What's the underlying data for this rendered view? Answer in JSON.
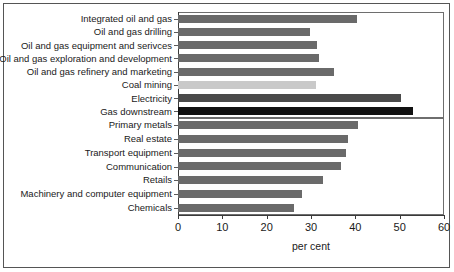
{
  "chart_data": {
    "type": "bar",
    "orientation": "horizontal",
    "title": "",
    "xlabel": "per cent",
    "ylabel": "",
    "xlim": [
      0,
      60
    ],
    "xticks": [
      0,
      10,
      20,
      30,
      40,
      50,
      60
    ],
    "xtick_labels": [
      "0",
      "10",
      "20",
      "30",
      "40",
      "50",
      "60"
    ],
    "grid": false,
    "legend": false,
    "categories": [
      "Integrated oil and gas",
      "Oil and gas drilling",
      "Oil and gas equipment and serivces",
      "Oil and gas exploration and development",
      "Oil and gas refinery and marketing",
      "Coal mining",
      "Electricity",
      "Gas downstream",
      "Primary metals",
      "Real estate",
      "Transport equipment",
      "Communication",
      "Retails",
      "Machinery and computer equipment",
      "Chemicals"
    ],
    "values": [
      40.3,
      29.7,
      31.4,
      31.8,
      35.1,
      31.2,
      50.2,
      53.0,
      40.6,
      38.4,
      37.9,
      36.7,
      32.6,
      27.9,
      26.1
    ],
    "bar_tones": [
      "medium",
      "medium",
      "medium",
      "medium",
      "medium",
      "light",
      "dark",
      "black",
      "medium",
      "medium",
      "medium",
      "medium",
      "medium",
      "medium",
      "medium"
    ],
    "group_split_after_index": 7,
    "colors": {
      "bar_medium": "#6a6a6a",
      "bar_light": "#c9c9c9",
      "bar_dark": "#4a4a4a",
      "bar_black": "#111111",
      "axis": "#3a3a3a",
      "frame": "#6e6e6e",
      "text": "#1a1a1a",
      "background": "#ffffff"
    }
  }
}
